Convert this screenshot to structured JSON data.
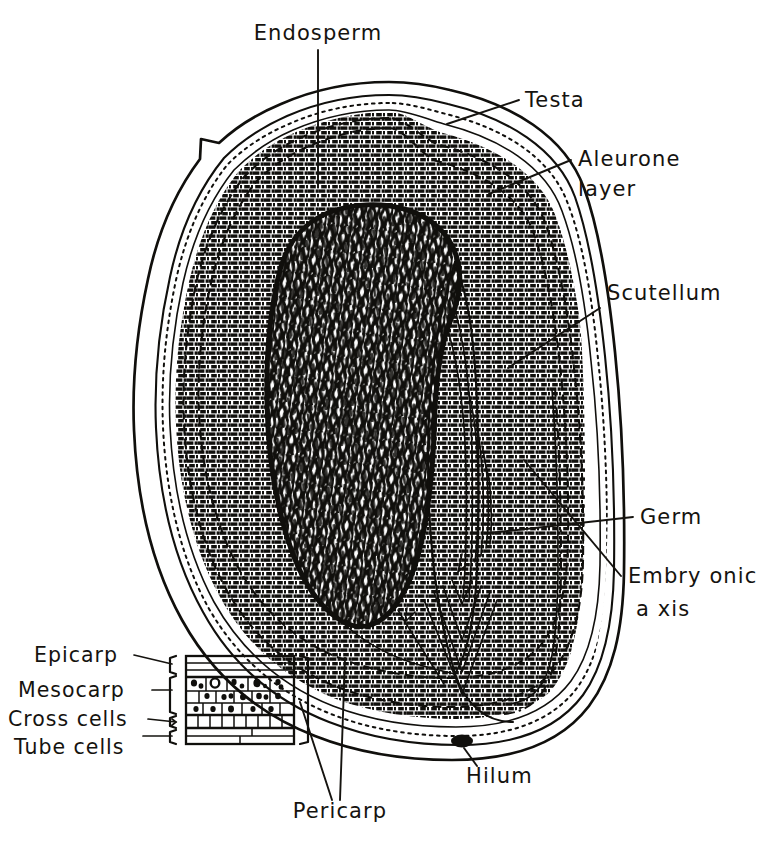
{
  "figure": {
    "background_color": "#ffffff",
    "ink_color": "#15130f"
  },
  "labels": [
    {
      "id": "endosperm",
      "text": "Endosperm",
      "text2": ""
    },
    {
      "id": "testa",
      "text": "Testa",
      "text2": ""
    },
    {
      "id": "aleurone",
      "text": "Aleurone",
      "text2": "layer"
    },
    {
      "id": "scutellum",
      "text": "Scutellum",
      "text2": ""
    },
    {
      "id": "germ",
      "text": "Germ",
      "text2": ""
    },
    {
      "id": "embryonic_axis",
      "text": "Embry onic",
      "text2": "a xis"
    },
    {
      "id": "hilum",
      "text": "Hilum",
      "text2": ""
    },
    {
      "id": "pericarp",
      "text": "Pericarp",
      "text2": ""
    }
  ],
  "inset": {
    "name": "pericarp-detail-inset",
    "layers": [
      {
        "id": "epicarp",
        "label": "Epicarp"
      },
      {
        "id": "mesocarp",
        "label": "Mesocarp"
      },
      {
        "id": "cross_cells",
        "label": "Cross cells"
      },
      {
        "id": "tube_cells",
        "label": "Tube cells"
      }
    ],
    "bracket_label": "Pericarp"
  },
  "structures": [
    {
      "id": "kernel-outline",
      "name": "wheat-grain-outline"
    },
    {
      "id": "pericarp-band",
      "name": "pericarp-wall-band"
    },
    {
      "id": "aleurone-band",
      "name": "aleurone-layer-band"
    },
    {
      "id": "endosperm-mass",
      "name": "endosperm-starchy-mass"
    },
    {
      "id": "scutellum-shape",
      "name": "scutellum-shield"
    },
    {
      "id": "germ-region",
      "name": "germ-embryo-region"
    },
    {
      "id": "embryonic-axis",
      "name": "embryonic-axis-plumule-radicle"
    },
    {
      "id": "hilum-dot",
      "name": "hilum-mark"
    }
  ]
}
